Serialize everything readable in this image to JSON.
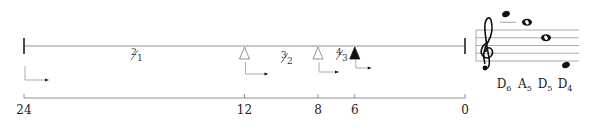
{
  "timeline": {
    "axis_ticks": [
      {
        "value": 24,
        "label": "24"
      },
      {
        "value": 12,
        "label": "12"
      },
      {
        "value": 8,
        "label": "8"
      },
      {
        "value": 6,
        "label": "6"
      },
      {
        "value": 0,
        "label": "0"
      }
    ],
    "markers": [
      {
        "value": 12,
        "style": "hollow"
      },
      {
        "value": 8,
        "style": "hollow"
      },
      {
        "value": 6,
        "style": "filled"
      }
    ],
    "ratios": [
      {
        "num": "2",
        "den": "1",
        "between": [
          24,
          12
        ]
      },
      {
        "num": "3",
        "den": "2",
        "between": [
          12,
          8
        ]
      },
      {
        "num": "4",
        "den": "3",
        "between": [
          8,
          6
        ]
      }
    ],
    "arrows": [
      {
        "start": 24,
        "length": "long"
      },
      {
        "start": 12,
        "length": "medium"
      },
      {
        "start": 8,
        "length": "short"
      },
      {
        "start": 6,
        "length": "shorter"
      }
    ]
  },
  "staff": {
    "clef": "treble-clef",
    "notes": [
      {
        "name": "D",
        "octave": "6",
        "type": "filled"
      },
      {
        "name": "A",
        "octave": "5",
        "type": "whole"
      },
      {
        "name": "D",
        "octave": "5",
        "type": "whole"
      },
      {
        "name": "D",
        "octave": "4",
        "type": "filled"
      }
    ]
  }
}
